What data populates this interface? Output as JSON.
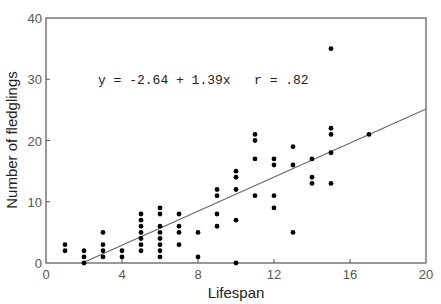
{
  "chart_data": {
    "type": "scatter",
    "title": "",
    "xlabel": "Lifespan",
    "ylabel": "Number of fledglings",
    "xlim": [
      0,
      20
    ],
    "ylim": [
      0,
      40
    ],
    "xticks": [
      0,
      4,
      8,
      12,
      16,
      20
    ],
    "yticks": [
      0,
      10,
      20,
      30,
      40
    ],
    "grid": false,
    "legend": null,
    "annotation": "y = -2.64 + 1.39x   r = .82",
    "regression": {
      "intercept": -2.64,
      "slope": 1.39,
      "r": 0.82,
      "x_start": 2,
      "x_end": 20
    },
    "points": [
      [
        1,
        2
      ],
      [
        1,
        3
      ],
      [
        2,
        0
      ],
      [
        2,
        1
      ],
      [
        2,
        2
      ],
      [
        3,
        1
      ],
      [
        3,
        2
      ],
      [
        3,
        3
      ],
      [
        3,
        5
      ],
      [
        4,
        1
      ],
      [
        4,
        2
      ],
      [
        5,
        2
      ],
      [
        5,
        3
      ],
      [
        5,
        4
      ],
      [
        5,
        5
      ],
      [
        5,
        6
      ],
      [
        5,
        7
      ],
      [
        5,
        8
      ],
      [
        6,
        1
      ],
      [
        6,
        2
      ],
      [
        6,
        3
      ],
      [
        6,
        4
      ],
      [
        6,
        5
      ],
      [
        6,
        6
      ],
      [
        6,
        8
      ],
      [
        6,
        9
      ],
      [
        7,
        3
      ],
      [
        7,
        5
      ],
      [
        7,
        6
      ],
      [
        7,
        8
      ],
      [
        8,
        1
      ],
      [
        8,
        5
      ],
      [
        9,
        6
      ],
      [
        9,
        8
      ],
      [
        9,
        11
      ],
      [
        9,
        12
      ],
      [
        10,
        0
      ],
      [
        10,
        7
      ],
      [
        10,
        12
      ],
      [
        10,
        14
      ],
      [
        10,
        15
      ],
      [
        11,
        11
      ],
      [
        11,
        17
      ],
      [
        11,
        20
      ],
      [
        11,
        21
      ],
      [
        12,
        9
      ],
      [
        12,
        11
      ],
      [
        12,
        16
      ],
      [
        12,
        17
      ],
      [
        13,
        5
      ],
      [
        13,
        16
      ],
      [
        13,
        19
      ],
      [
        14,
        13
      ],
      [
        14,
        14
      ],
      [
        14,
        17
      ],
      [
        15,
        13
      ],
      [
        15,
        18
      ],
      [
        15,
        21
      ],
      [
        15,
        22
      ],
      [
        15,
        35
      ],
      [
        17,
        21
      ]
    ]
  },
  "labels": {
    "x_axis": "Lifespan",
    "y_axis": "Number of fledglings",
    "equation": "y = -2.64 + 1.39x   r = .82",
    "xticks": [
      "0",
      "4",
      "8",
      "12",
      "16",
      "20"
    ],
    "yticks": [
      "0",
      "10",
      "20",
      "30",
      "40"
    ]
  }
}
